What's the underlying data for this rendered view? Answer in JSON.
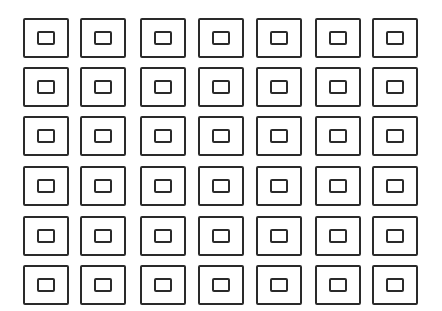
{
  "figure": {
    "rows": 6,
    "columns": 7,
    "stroke_color": "#2a2a2a",
    "background_color": "#ffffff",
    "column_x": [
      23,
      80,
      140,
      198,
      256,
      315,
      372
    ],
    "row_y": [
      18,
      67,
      116,
      166,
      216,
      265
    ],
    "outer_size": {
      "width": 46,
      "height": 40
    },
    "inner_size": {
      "width": 18,
      "height": 14
    }
  }
}
